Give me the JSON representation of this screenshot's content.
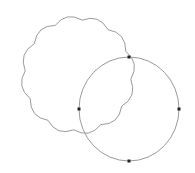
{
  "canvas": {
    "width": 195,
    "height": 173,
    "background": "#ffffff"
  },
  "shapes": {
    "cloud": {
      "label": "cloud-shape",
      "cx": 78,
      "cy": 75,
      "rx": 58,
      "ry": 60,
      "bumps": 12,
      "stroke": "#9a9a9a"
    },
    "ellipse": {
      "label": "selected-ellipse",
      "cx": 129,
      "cy": 109,
      "rx": 50,
      "ry": 52,
      "stroke": "#9a9a9a"
    }
  },
  "handles": [
    {
      "name": "top",
      "x": 129,
      "y": 57
    },
    {
      "name": "left",
      "x": 79,
      "y": 109
    },
    {
      "name": "right",
      "x": 179,
      "y": 109
    },
    {
      "name": "bottom",
      "x": 129,
      "y": 161
    }
  ],
  "colors": {
    "stroke": "#9a9a9a",
    "handle": "#222222"
  }
}
